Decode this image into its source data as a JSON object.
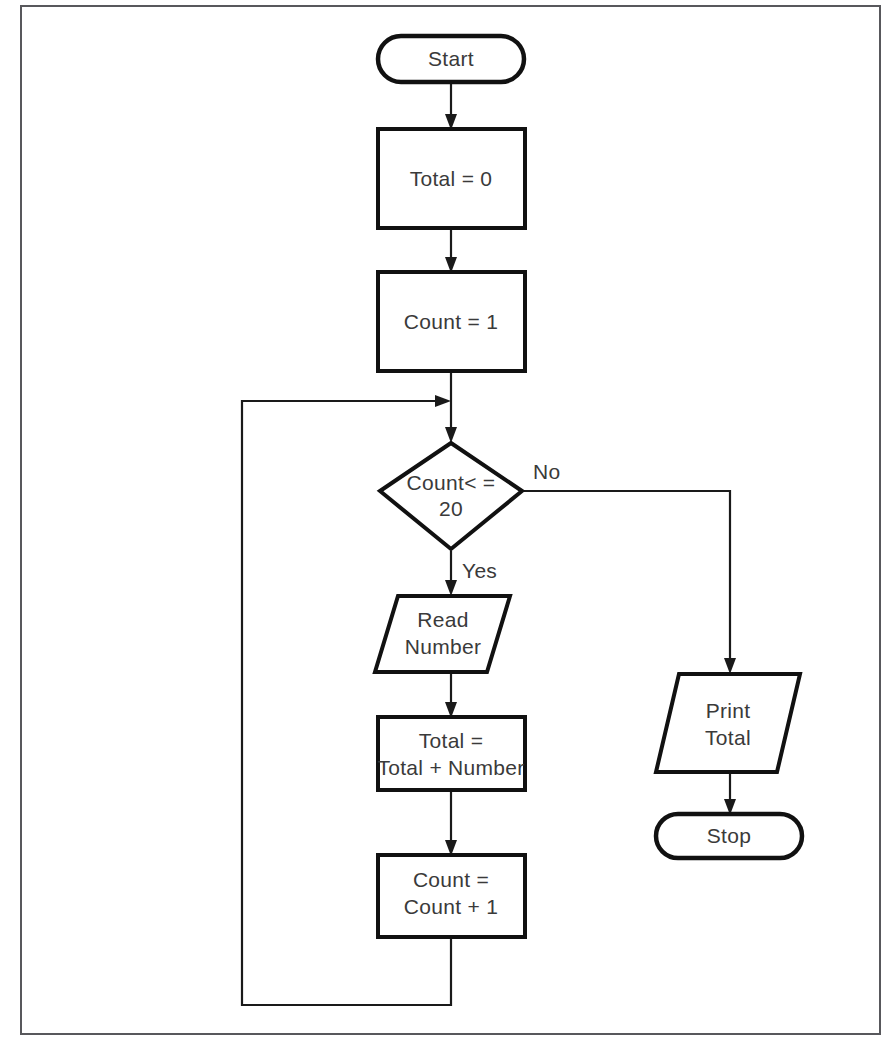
{
  "diagram": {
    "background_color": "#ffffff",
    "line_color": "#1a1a1a",
    "text_color": "#3a3a3a",
    "frame_color": "#58585c"
  },
  "nodes": {
    "start": {
      "label": "Start",
      "shape": "terminator"
    },
    "init_total": {
      "label": "Total = 0",
      "shape": "process"
    },
    "init_count": {
      "label": "Count = 1",
      "shape": "process"
    },
    "decision": {
      "line1": "Count< =",
      "line2": "20",
      "shape": "decision"
    },
    "read": {
      "line1": "Read",
      "line2": "Number",
      "shape": "io-parallelogram"
    },
    "accumulate": {
      "line1": "Total =",
      "line2": "Total + Number",
      "shape": "process"
    },
    "increment": {
      "line1": "Count =",
      "line2": "Count + 1",
      "shape": "process"
    },
    "print": {
      "line1": "Print",
      "line2": "Total",
      "shape": "io-parallelogram"
    },
    "stop": {
      "label": "Stop",
      "shape": "terminator"
    }
  },
  "branch_labels": {
    "yes": "Yes",
    "no": "No"
  }
}
